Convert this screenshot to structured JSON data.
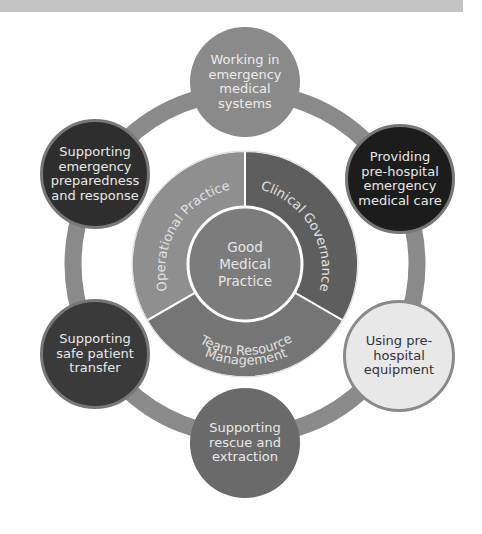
{
  "diagram": {
    "center": {
      "label": "Good\nMedical\nPractice"
    },
    "segments": [
      {
        "id": "operational",
        "label": "Operational Practice",
        "color": "#8f8f8f"
      },
      {
        "id": "clinical",
        "label": "Clinical Governance",
        "color": "#5e5e5e"
      },
      {
        "id": "team",
        "label": "Team Resource Management",
        "line1": "Team Resource",
        "line2": "Management",
        "color": "#757575"
      }
    ],
    "ring_color": "#8a8a8a",
    "nodes": [
      {
        "id": "working",
        "label": "Working in\nemergency\nmedical\nsystems",
        "fill": "#8a8a8a",
        "text": "#ececec"
      },
      {
        "id": "providing",
        "label": "Providing\npre-hospital\nemergency\nmedical care",
        "fill": "#1c1c1c",
        "text": "#e8e8e8"
      },
      {
        "id": "using",
        "label": "Using pre-\nhospital\nequipment",
        "fill": "#e8e8e8",
        "text": "#333333"
      },
      {
        "id": "rescue",
        "label": "Supporting\nrescue and\nextraction",
        "fill": "#6a6a6a",
        "text": "#e8e8e8"
      },
      {
        "id": "transfer",
        "label": "Supporting\nsafe patient\ntransfer",
        "fill": "#3a3a3a",
        "text": "#e8e8e8"
      },
      {
        "id": "preparedness",
        "label": "Supporting\nemergency\npreparedness\nand response",
        "fill": "#2e2e2e",
        "text": "#e8e8e8"
      }
    ]
  }
}
